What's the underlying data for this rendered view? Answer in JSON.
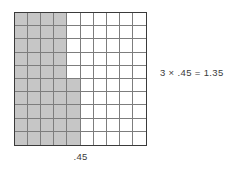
{
  "figure": {
    "type": "decimal-multiplication-area-model",
    "equation": "3 × .45 = 1.35",
    "width_label": ".45"
  },
  "colors": {
    "shaded_cell": "#c6c6c6",
    "empty_cell": "#ffffff",
    "grid_line": "#7d7d7d",
    "grid_border": "#3a3a3a",
    "text": "#3b3b3b",
    "background": "#ffffff"
  },
  "chart_data": {
    "type": "heatmap",
    "title": "3 × .45 = 1.35",
    "xlabel": ".45",
    "ylabel": "",
    "rows": 10,
    "columns": 10,
    "legend": [
      "shaded",
      "unshaded"
    ],
    "shaded_count": 45,
    "total_count": 100,
    "grid": [
      [
        1,
        1,
        1,
        1,
        0,
        0,
        0,
        0,
        0,
        0
      ],
      [
        1,
        1,
        1,
        1,
        0,
        0,
        0,
        0,
        0,
        0
      ],
      [
        1,
        1,
        1,
        1,
        0,
        0,
        0,
        0,
        0,
        0
      ],
      [
        1,
        1,
        1,
        1,
        0,
        0,
        0,
        0,
        0,
        0
      ],
      [
        1,
        1,
        1,
        1,
        0,
        0,
        0,
        0,
        0,
        0
      ],
      [
        1,
        1,
        1,
        1,
        1,
        0,
        0,
        0,
        0,
        0
      ],
      [
        1,
        1,
        1,
        1,
        1,
        0,
        0,
        0,
        0,
        0
      ],
      [
        1,
        1,
        1,
        1,
        1,
        0,
        0,
        0,
        0,
        0
      ],
      [
        1,
        1,
        1,
        1,
        1,
        0,
        0,
        0,
        0,
        0
      ],
      [
        1,
        1,
        1,
        1,
        1,
        0,
        0,
        0,
        0,
        0
      ]
    ]
  }
}
